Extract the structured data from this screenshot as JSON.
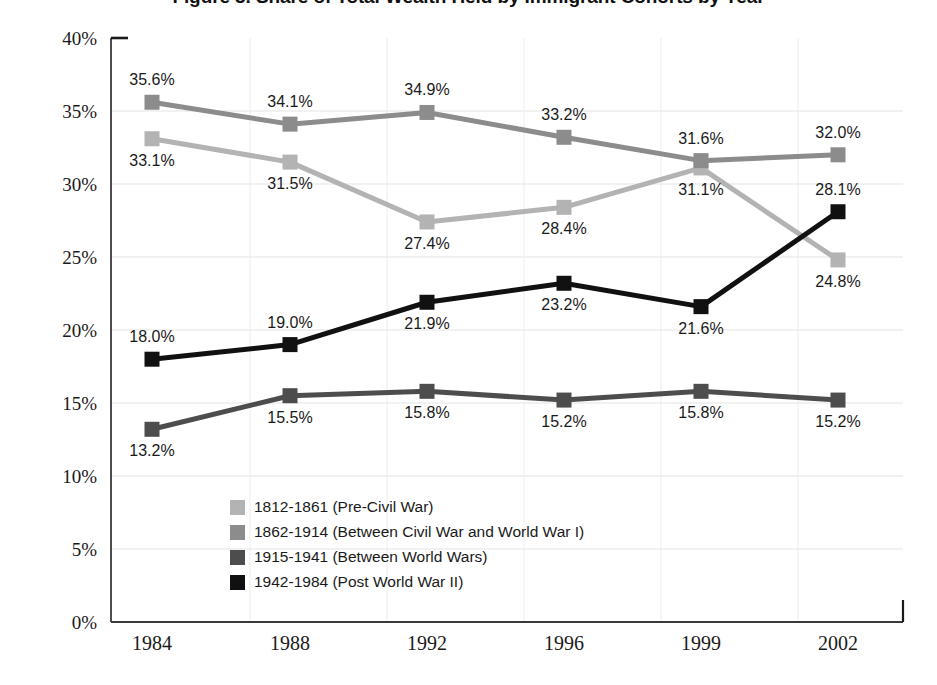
{
  "chart_data": {
    "type": "line",
    "title": "Figure 3. Share of Total Wealth Held by Immigrant Cohorts by Year",
    "xlabel": "",
    "ylabel": "",
    "categories": [
      "1984",
      "1988",
      "1992",
      "1996",
      "1999",
      "2002"
    ],
    "ylim": [
      0,
      40
    ],
    "ytick_labels": [
      "0%",
      "5%",
      "10%",
      "15%",
      "20%",
      "25%",
      "30%",
      "35%",
      "40%"
    ],
    "ytick_values": [
      0,
      5,
      10,
      15,
      20,
      25,
      30,
      35,
      40
    ],
    "grid": true,
    "legend_position": "inside-bottom-left",
    "series": [
      {
        "name": "1812-1861 (Pre-Civil War)",
        "color": "#b3b3b3",
        "values": [
          33.1,
          31.5,
          27.4,
          28.4,
          31.1,
          24.8
        ],
        "labels": [
          "33.1%",
          "31.5%",
          "27.4%",
          "28.4%",
          "31.1%",
          "24.8%"
        ],
        "label_positions": [
          "below",
          "below",
          "below",
          "below",
          "below",
          "below"
        ]
      },
      {
        "name": "1862-1914 (Between Civil War and World War I)",
        "color": "#8c8c8c",
        "values": [
          35.6,
          34.1,
          34.9,
          33.2,
          31.6,
          32.0
        ],
        "labels": [
          "35.6%",
          "34.1%",
          "34.9%",
          "33.2%",
          "31.6%",
          "32.0%"
        ],
        "label_positions": [
          "above",
          "above",
          "above",
          "above",
          "above",
          "above"
        ]
      },
      {
        "name": "1915-1941 (Between World Wars)",
        "color": "#4d4d4d",
        "values": [
          13.2,
          15.5,
          15.8,
          15.2,
          15.8,
          15.2
        ],
        "labels": [
          "13.2%",
          "15.5%",
          "15.8%",
          "15.2%",
          "15.8%",
          "15.2%"
        ],
        "label_positions": [
          "below",
          "below",
          "below",
          "below",
          "below",
          "below"
        ]
      },
      {
        "name": "1942-1984 (Post World War II)",
        "color": "#111111",
        "values": [
          18.0,
          19.0,
          21.9,
          23.2,
          21.6,
          28.1
        ],
        "labels": [
          "18.0%",
          "19.0%",
          "21.9%",
          "23.2%",
          "21.6%",
          "28.1%"
        ],
        "label_positions": [
          "above",
          "above",
          "below",
          "below",
          "below",
          "above"
        ]
      }
    ]
  },
  "legend": {
    "items": [
      {
        "label": "1812-1861 (Pre-Civil War)",
        "color": "#b3b3b3"
      },
      {
        "label": "1862-1914 (Between Civil War and World War I)",
        "color": "#8c8c8c"
      },
      {
        "label": "1915-1941 (Between World Wars)",
        "color": "#4d4d4d"
      },
      {
        "label": "1942-1984 (Post World War II)",
        "color": "#111111"
      }
    ]
  },
  "axes": {
    "y_axis_color": "#3a3a3a",
    "x_axis_color": "#3a3a3a",
    "grid_color": "#e3e3e3"
  }
}
